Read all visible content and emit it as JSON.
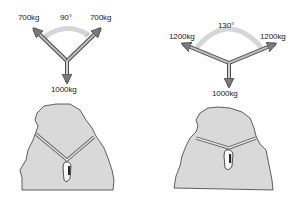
{
  "diagram": {
    "colors": {
      "arrow_fill": "#8c8c8c",
      "arrow_stroke": "#4a4a4a",
      "arc": "#d6d6d6",
      "rock_fill": "#d9d9d9",
      "rock_stroke": "#3a3a3a",
      "sling": "#bdbdbd"
    },
    "left": {
      "angle_label": "90°",
      "left_force": "700kg",
      "right_force": "700kg",
      "load": "1000kg"
    },
    "right": {
      "angle_label": "130°",
      "left_force": "1200kg",
      "right_force": "1200kg",
      "load": "1000kg"
    }
  }
}
